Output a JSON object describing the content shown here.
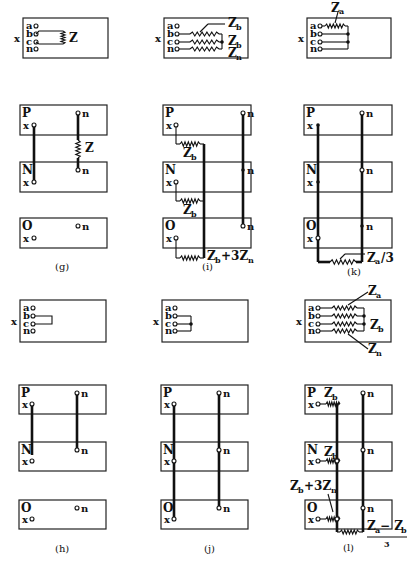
{
  "figure": {
    "panels": [
      {
        "id": "g",
        "caption": "(g)",
        "bus_label": "x",
        "terminals": [
          "a",
          "b",
          "c",
          "n"
        ],
        "impedance_top": "Z",
        "sequence_networks": [
          "P",
          "N",
          "O"
        ],
        "node_x": "x",
        "node_n": "n",
        "impedance_between": "Z"
      },
      {
        "id": "i",
        "caption": "(i)",
        "bus_label": "x",
        "terminals": [
          "a",
          "b",
          "c",
          "n"
        ],
        "impedance_labels": [
          "Z",
          "b",
          "Z",
          "b",
          "Z",
          "n"
        ],
        "sequence_networks": [
          "P",
          "N",
          "O"
        ],
        "node_x": "x",
        "node_n": "n",
        "zb": "Z",
        "zb_sub": "b",
        "zero_label_main": "Z",
        "zero_label_sub1": "b",
        "zero_label_plus": "+3Z",
        "zero_label_sub2": "n"
      },
      {
        "id": "k",
        "caption": "(k)",
        "bus_label": "x",
        "terminals": [
          "a",
          "b",
          "c",
          "n"
        ],
        "za": "Z",
        "za_sub": "a",
        "sequence_networks": [
          "P",
          "N",
          "O"
        ],
        "node_x": "x",
        "node_n": "n",
        "zero_label": "/3"
      },
      {
        "id": "h",
        "caption": "(h)",
        "bus_label": "x",
        "terminals": [
          "a",
          "b",
          "c",
          "n"
        ],
        "sequence_networks": [
          "P",
          "N",
          "O"
        ],
        "node_x": "x",
        "node_n": "n"
      },
      {
        "id": "j",
        "caption": "(j)",
        "bus_label": "x",
        "terminals": [
          "a",
          "b",
          "c",
          "n"
        ],
        "sequence_networks": [
          "P",
          "N",
          "O"
        ],
        "node_x": "x",
        "node_n": "n"
      },
      {
        "id": "l",
        "caption": "(l)",
        "bus_label": "x",
        "terminals": [
          "a",
          "b",
          "c",
          "n"
        ],
        "za": "Z",
        "za_sub": "a",
        "zb": "Z",
        "zb_sub": "b",
        "zn": "Z",
        "zn_sub": "n",
        "sequence_networks": [
          "P",
          "N",
          "O"
        ],
        "node_x": "x",
        "node_n": "n",
        "zero_label_main": "Z",
        "zero_label_sub1": "b",
        "zero_label_plus": "+3Z",
        "zero_label_sub2": "n",
        "fraction_num_a": "Z",
        "fraction_num_a_sub": "a",
        "fraction_minus": " − Z",
        "fraction_num_b_sub": "b",
        "fraction_den": "3"
      }
    ]
  }
}
